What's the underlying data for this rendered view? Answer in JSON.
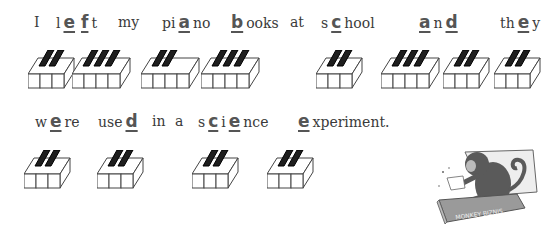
{
  "worksheet": {
    "line1": {
      "words": [
        {
          "pre": "I",
          "note": "",
          "post": ""
        },
        {
          "pre": "l",
          "note": "e f",
          "post": "t"
        },
        {
          "pre": "my",
          "note": "",
          "post": ""
        },
        {
          "pre": "pi",
          "note": "a",
          "post": "no"
        },
        {
          "pre": "",
          "note": "b",
          "post": "ooks"
        },
        {
          "pre": "at",
          "note": "",
          "post": ""
        },
        {
          "pre": "s",
          "note": "c",
          "post": "hool"
        },
        {
          "pre": "",
          "note": "a",
          "post": "n"
        },
        {
          "pre": "th",
          "note": "e",
          "post": "y"
        }
      ],
      "w1": "I",
      "w2_pre": "l",
      "w2_n1": "e",
      "w2_n2": "f",
      "w2_post": "t",
      "w3": "my",
      "w4_pre": "pi",
      "w4_n": "a",
      "w4_post": "no",
      "w5_n": "b",
      "w5_post": "ooks",
      "w6": "at",
      "w7_pre": "s",
      "w7_n": "c",
      "w7_post": "hool",
      "w8_n1": "a",
      "w8_mid": "n",
      "w8_n2": "d",
      "w9_pre": "th",
      "w9_n": "e",
      "w9_post": "y"
    },
    "line2": {
      "w1_pre": "w",
      "w1_n": "e",
      "w1_post": "re",
      "w2_pre": "use",
      "w2_n": "d",
      "w3": "in",
      "w4": "a",
      "w5_pre": "s",
      "w5_n1": "c",
      "w5_mid": "i",
      "w5_n2": "e",
      "w5_post": "nce",
      "w6_n": "e",
      "w6_post": "xperiment."
    },
    "sentence": "I left my piano books at school and they were used in a science experiment.",
    "note_letters": [
      "e",
      "f",
      "a",
      "b",
      "c",
      "a",
      "d",
      "e",
      "e",
      "d",
      "c",
      "e",
      "e"
    ],
    "illustration": {
      "subject": "monkey-in-box",
      "box_label": "MONKEY BIZNIS"
    },
    "colors": {
      "ink": "#3a3a3a",
      "note": "#555555",
      "black_key": "#1e1e1e",
      "white_key": "#ffffff"
    }
  }
}
